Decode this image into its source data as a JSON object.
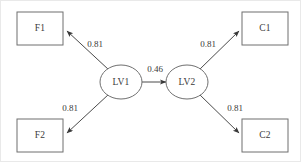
{
  "diagram": {
    "type": "path-diagram",
    "title": "",
    "background_color": "#ffffff",
    "stroke_color": "#6f6f6f",
    "text_color": "#3a3a3a",
    "nodes": [
      {
        "id": "F1",
        "label": "F1",
        "shape": "rectangle",
        "x": 39,
        "y": 27
      },
      {
        "id": "F2",
        "label": "F2",
        "shape": "rectangle",
        "x": 39,
        "y": 135
      },
      {
        "id": "LV1",
        "label": "LV1",
        "shape": "ellipse",
        "x": 120,
        "y": 81
      },
      {
        "id": "LV2",
        "label": "LV2",
        "shape": "ellipse",
        "x": 186,
        "y": 81
      },
      {
        "id": "C1",
        "label": "C1",
        "shape": "rectangle",
        "x": 265,
        "y": 27
      },
      {
        "id": "C2",
        "label": "C2",
        "shape": "rectangle",
        "x": 265,
        "y": 135
      }
    ],
    "edges": [
      {
        "from": "LV1",
        "to": "F1",
        "label": "0.81",
        "label_x": 94,
        "label_y": 44
      },
      {
        "from": "LV1",
        "to": "F2",
        "label": "0.81",
        "label_x": 69,
        "label_y": 108
      },
      {
        "from": "LV1",
        "to": "LV2",
        "label": "0.46",
        "label_x": 154,
        "label_y": 69
      },
      {
        "from": "LV2",
        "to": "C1",
        "label": "0.81",
        "label_x": 207,
        "label_y": 44
      },
      {
        "from": "LV2",
        "to": "C2",
        "label": "0.81",
        "label_x": 234,
        "label_y": 108
      }
    ]
  }
}
